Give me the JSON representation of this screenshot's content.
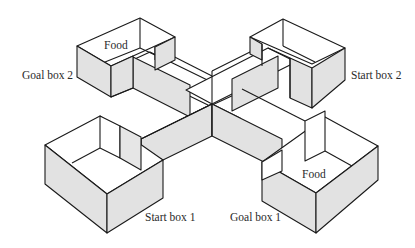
{
  "figure": {
    "type": "plus-maze diagram",
    "labels": {
      "goal_box_2": "Goal box 2",
      "start_box_2": "Start box 2",
      "start_box_1": "Start box 1",
      "goal_box_1": "Goal box 1",
      "food_top": "Food",
      "food_bottom": "Food"
    },
    "colors": {
      "background": "#ffffff",
      "shaded_wall": "#e2e2e2",
      "outline": "#1a1a1a",
      "text": "#2a2a2a"
    }
  }
}
